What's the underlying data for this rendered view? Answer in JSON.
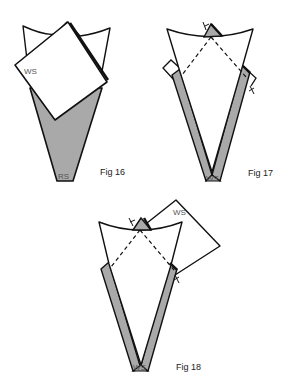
{
  "figures": [
    {
      "id": "fig16",
      "caption": "Fig 16",
      "labels": {
        "square": "WS",
        "cone": "RS"
      }
    },
    {
      "id": "fig17",
      "caption": "Fig 17",
      "labels": {
        "bottom": "WS"
      }
    },
    {
      "id": "fig18",
      "caption": "Fig 18",
      "labels": {
        "square": "WS",
        "bottom": "WS"
      }
    }
  ],
  "colors": {
    "fabric_right_side": "#a9a9a9",
    "fabric_wrong_side": "#ffffff",
    "outline": "#111111"
  }
}
